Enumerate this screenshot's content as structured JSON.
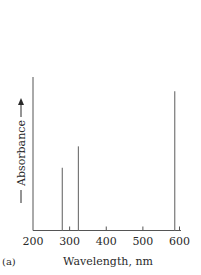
{
  "chart_data": {
    "type": "bar",
    "style": "line-spectrum",
    "title": "",
    "panel_label": "(a)",
    "xlabel": "Wavelength, nm",
    "ylabel": "Absorbance",
    "ylabel_arrow": "up",
    "xlim": [
      200,
      600
    ],
    "ylim": [
      0,
      1
    ],
    "xticks": [
      200,
      300,
      400,
      500,
      600
    ],
    "xtick_labels": [
      "200",
      "300",
      "400",
      "500",
      "600"
    ],
    "yticks": [],
    "grid": false,
    "legend": "none",
    "series": [
      {
        "name": "Absorption lines",
        "x": [
          280,
          324,
          587
        ],
        "values": [
          0.41,
          0.55,
          0.91
        ]
      }
    ],
    "colors": {
      "axis": "#555555",
      "lines": "#777777",
      "text": "#2a2a2a"
    }
  }
}
